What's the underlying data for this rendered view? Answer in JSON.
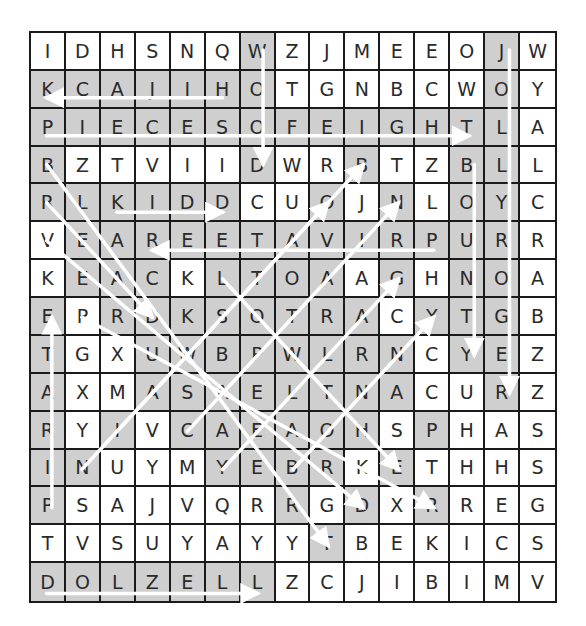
{
  "puzzle": {
    "type": "word-search",
    "rows": 15,
    "cols": 15,
    "grid": [
      [
        "I",
        "D",
        "H",
        "S",
        "N",
        "Q",
        "W",
        "Z",
        "J",
        "M",
        "E",
        "E",
        "O",
        "J",
        "W"
      ],
      [
        "K",
        "C",
        "A",
        "J",
        "I",
        "H",
        "O",
        "T",
        "G",
        "N",
        "B",
        "C",
        "W",
        "O",
        "Y"
      ],
      [
        "P",
        "I",
        "E",
        "C",
        "E",
        "S",
        "O",
        "F",
        "E",
        "I",
        "G",
        "H",
        "T",
        "L",
        "A"
      ],
      [
        "B",
        "Z",
        "T",
        "V",
        "I",
        "I",
        "D",
        "W",
        "R",
        "B",
        "T",
        "Z",
        "B",
        "L",
        "L"
      ],
      [
        "R",
        "L",
        "K",
        "I",
        "D",
        "D",
        "C",
        "U",
        "O",
        "J",
        "N",
        "L",
        "O",
        "Y",
        "C"
      ],
      [
        "V",
        "E",
        "A",
        "R",
        "E",
        "E",
        "T",
        "A",
        "V",
        "I",
        "R",
        "P",
        "U",
        "R",
        "R"
      ],
      [
        "K",
        "E",
        "A",
        "C",
        "K",
        "L",
        "T",
        "O",
        "A",
        "A",
        "G",
        "H",
        "N",
        "O",
        "A"
      ],
      [
        "E",
        "P",
        "R",
        "D",
        "K",
        "S",
        "O",
        "T",
        "R",
        "A",
        "C",
        "Y",
        "T",
        "G",
        "B"
      ],
      [
        "T",
        "G",
        "X",
        "U",
        "W",
        "B",
        "P",
        "W",
        "L",
        "R",
        "N",
        "C",
        "Y",
        "E",
        "Z"
      ],
      [
        "A",
        "X",
        "M",
        "A",
        "S",
        "A",
        "E",
        "L",
        "T",
        "N",
        "A",
        "C",
        "U",
        "R",
        "Z"
      ],
      [
        "R",
        "Y",
        "I",
        "V",
        "C",
        "A",
        "E",
        "A",
        "O",
        "H",
        "S",
        "P",
        "H",
        "A",
        "S"
      ],
      [
        "I",
        "N",
        "U",
        "Y",
        "M",
        "Y",
        "E",
        "B",
        "R",
        "K",
        "E",
        "T",
        "H",
        "H",
        "S"
      ],
      [
        "P",
        "S",
        "A",
        "J",
        "V",
        "Q",
        "R",
        "R",
        "G",
        "D",
        "X",
        "R",
        "R",
        "E",
        "G"
      ],
      [
        "T",
        "V",
        "S",
        "U",
        "Y",
        "A",
        "Y",
        "Y",
        "T",
        "B",
        "E",
        "K",
        "I",
        "C",
        "S"
      ],
      [
        "D",
        "O",
        "L",
        "Z",
        "E",
        "L",
        "L",
        "Z",
        "C",
        "J",
        "I",
        "B",
        "I",
        "M",
        "V"
      ]
    ],
    "shaded": [
      [
        0,
        0,
        0,
        0,
        0,
        0,
        1,
        0,
        0,
        0,
        0,
        0,
        0,
        1,
        0
      ],
      [
        1,
        1,
        1,
        1,
        1,
        1,
        1,
        0,
        0,
        0,
        0,
        0,
        0,
        1,
        0
      ],
      [
        1,
        1,
        1,
        1,
        1,
        1,
        1,
        1,
        1,
        1,
        1,
        1,
        1,
        1,
        0
      ],
      [
        1,
        0,
        0,
        0,
        0,
        0,
        1,
        0,
        0,
        1,
        0,
        0,
        1,
        1,
        0
      ],
      [
        1,
        1,
        1,
        1,
        1,
        1,
        0,
        0,
        1,
        0,
        1,
        0,
        1,
        1,
        0
      ],
      [
        0,
        1,
        1,
        1,
        1,
        1,
        1,
        1,
        1,
        1,
        1,
        1,
        1,
        1,
        0
      ],
      [
        0,
        1,
        1,
        1,
        0,
        1,
        1,
        1,
        1,
        0,
        1,
        0,
        1,
        1,
        0
      ],
      [
        1,
        0,
        1,
        1,
        1,
        1,
        1,
        1,
        1,
        1,
        0,
        1,
        1,
        1,
        0
      ],
      [
        1,
        0,
        0,
        1,
        1,
        1,
        1,
        1,
        1,
        1,
        1,
        0,
        1,
        1,
        0
      ],
      [
        1,
        0,
        0,
        1,
        1,
        1,
        1,
        1,
        1,
        1,
        1,
        0,
        0,
        1,
        0
      ],
      [
        1,
        0,
        1,
        0,
        1,
        1,
        1,
        1,
        1,
        1,
        0,
        1,
        0,
        0,
        0
      ],
      [
        1,
        1,
        0,
        0,
        0,
        1,
        1,
        1,
        1,
        0,
        1,
        0,
        0,
        0,
        0
      ],
      [
        1,
        0,
        0,
        0,
        0,
        0,
        0,
        1,
        0,
        1,
        0,
        1,
        0,
        0,
        0
      ],
      [
        0,
        0,
        0,
        0,
        0,
        0,
        0,
        0,
        1,
        0,
        0,
        0,
        0,
        0,
        0
      ],
      [
        1,
        1,
        1,
        1,
        1,
        1,
        1,
        0,
        0,
        0,
        0,
        0,
        0,
        0,
        0
      ]
    ],
    "colors": {
      "shaded": "#cfcfcf",
      "cell": "#ffffff",
      "grid_line": "#1a1a1a",
      "letter": "#2a2a2a",
      "arrow": "#ffffff"
    },
    "arrows": [
      {
        "word": "HIJACK",
        "from": [
          1,
          5
        ],
        "to": [
          1,
          0
        ]
      },
      {
        "word": "PIECESOFEIGHT",
        "from": [
          2,
          0
        ],
        "to": [
          2,
          12
        ]
      },
      {
        "word": "WOOD",
        "from": [
          0,
          6
        ],
        "to": [
          3,
          6
        ]
      },
      {
        "word": "JOLLYROGER",
        "from": [
          0,
          13
        ],
        "to": [
          9,
          13
        ]
      },
      {
        "word": "BOUNTY",
        "from": [
          3,
          12
        ],
        "to": [
          8,
          12
        ]
      },
      {
        "word": "KIDD",
        "from": [
          4,
          2
        ],
        "to": [
          4,
          5
        ]
      },
      {
        "word": "PRIVATEER",
        "from": [
          5,
          11
        ],
        "to": [
          5,
          3
        ]
      },
      {
        "word": "PIRATE",
        "from": [
          12,
          0
        ],
        "to": [
          7,
          0
        ]
      },
      {
        "word": "DOLZELL",
        "from": [
          14,
          0
        ],
        "to": [
          14,
          6
        ]
      },
      {
        "word": "BLACKSPOT",
        "from": [
          3,
          0
        ],
        "to": [
          13,
          8
        ]
      },
      {
        "word": "READ",
        "from": [
          4,
          0
        ],
        "to": [
          7,
          3
        ]
      },
      {
        "word": "VEACKSWALAOB",
        "from": [
          5,
          0
        ],
        "to": [
          12,
          9
        ]
      },
      {
        "word": "EPR",
        "from": [
          7,
          1
        ],
        "to": [
          12,
          11
        ]
      },
      {
        "word": "LTRANRKS",
        "from": [
          6,
          5
        ],
        "to": [
          11,
          10
        ]
      },
      {
        "word": "NIAPE",
        "from": [
          11,
          1
        ],
        "to": [
          3,
          9
        ]
      },
      {
        "word": "IBEAT",
        "from": [
          10,
          2
        ],
        "to": [
          4,
          8
        ]
      },
      {
        "word": "CAORN",
        "from": [
          10,
          4
        ],
        "to": [
          4,
          10
        ]
      },
      {
        "word": "YECRAG",
        "from": [
          11,
          5
        ],
        "to": [
          6,
          10
        ]
      },
      {
        "word": "BHNAY",
        "from": [
          11,
          7
        ],
        "to": [
          7,
          11
        ]
      }
    ]
  }
}
